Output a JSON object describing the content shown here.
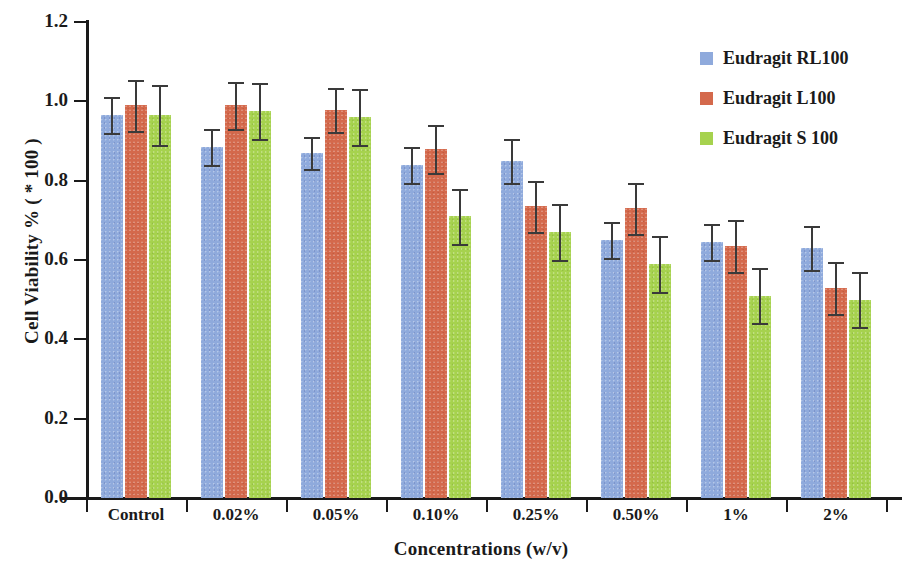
{
  "chart_data": {
    "type": "bar",
    "title": "",
    "xlabel": "Concentrations (w/v)",
    "ylabel": "Cell Viability % ( * 100 )",
    "categories": [
      "Control",
      "0.02%",
      "0.05%",
      "0.10%",
      "0.25%",
      "0.50%",
      "1%",
      "2%"
    ],
    "ylim": [
      0.0,
      1.2
    ],
    "ytick_labels": [
      "0.0",
      "0.2",
      "0.4",
      "0.6",
      "0.8",
      "1.0",
      "1.2"
    ],
    "ytick_values": [
      0.0,
      0.2,
      0.4,
      0.6,
      0.8,
      1.0,
      1.2
    ],
    "grid": false,
    "legend_position": "top-right",
    "series": [
      {
        "name": "Eudragit RL100",
        "color": "#8faadc",
        "values": [
          0.965,
          0.885,
          0.87,
          0.84,
          0.85,
          0.65,
          0.645,
          0.63
        ],
        "errors": [
          0.045,
          0.045,
          0.04,
          0.045,
          0.055,
          0.045,
          0.045,
          0.055
        ]
      },
      {
        "name": "Eudragit L100",
        "color": "#d4694c",
        "values": [
          0.99,
          0.99,
          0.978,
          0.88,
          0.735,
          0.73,
          0.635,
          0.53
        ],
        "errors": [
          0.065,
          0.06,
          0.055,
          0.06,
          0.065,
          0.065,
          0.065,
          0.065
        ]
      },
      {
        "name": "Eudragit S 100",
        "color": "#a6d24e",
        "values": [
          0.965,
          0.975,
          0.96,
          0.71,
          0.67,
          0.59,
          0.51,
          0.5
        ]
      }
    ]
  },
  "legend": {
    "items": [
      {
        "label": "Eudragit RL100",
        "color": "#8faadc"
      },
      {
        "label": "Eudragit L100",
        "color": "#d4694c"
      },
      {
        "label": "Eudragit S 100",
        "color": "#a6d24e"
      }
    ]
  },
  "series_extra_errors": {
    "Eudragit S 100": [
      0.075,
      0.07,
      0.07,
      0.07,
      0.07,
      0.07,
      0.07,
      0.07
    ]
  }
}
